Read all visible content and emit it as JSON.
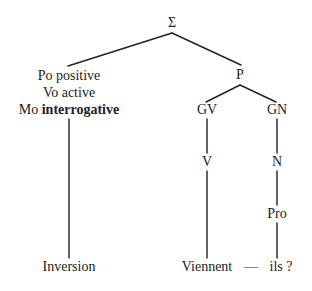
{
  "diagram": {
    "type": "syntactic-tree",
    "root": {
      "label": "Σ"
    },
    "features": {
      "polarity": {
        "prefix": "Po",
        "value": "positive"
      },
      "voice": {
        "prefix": "Vo",
        "value": "active"
      },
      "mood": {
        "prefix": "Mo",
        "value": "interrogative"
      }
    },
    "nodes": {
      "p": "P",
      "gv": "GV",
      "gn": "GN",
      "v": "V",
      "n": "N",
      "pro": "Pro"
    },
    "leaves": {
      "inversion": "Inversion",
      "verb": "Viennent",
      "dash": "—",
      "pronoun": "ils ?"
    },
    "colors": {
      "ink": "#222222",
      "background": "#ffffff"
    }
  }
}
